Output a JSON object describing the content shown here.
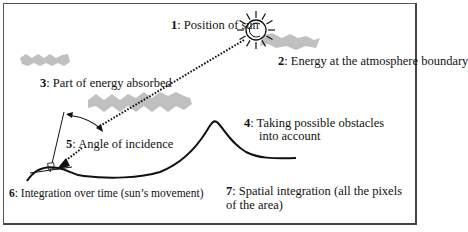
{
  "diagram": {
    "labels": [
      {
        "num": "1",
        "text": ": Position of sun"
      },
      {
        "num": "2",
        "text": ": Energy at the atmosphere boundary"
      },
      {
        "num": "3",
        "text": ": Part of energy absorbed"
      },
      {
        "num": "4",
        "text": ": Taking possible obstacles",
        "line2": "into account"
      },
      {
        "num": "5",
        "text": ": Angle of incidence"
      },
      {
        "num": "6",
        "text": ": Integration over time (sun’s movement)"
      },
      {
        "num": "7",
        "text": ": Spatial integration (all the pixels",
        "line2": "of the area)"
      }
    ],
    "icons": [
      "sun-icon",
      "cloud-icon",
      "cloud-icon",
      "cloud-icon",
      "mountain-terrain",
      "ray-arrow",
      "angle-arc",
      "normal-line"
    ],
    "colors": {
      "line": "#111111",
      "cloud": "#9a9a9a",
      "border": "#555555"
    }
  }
}
